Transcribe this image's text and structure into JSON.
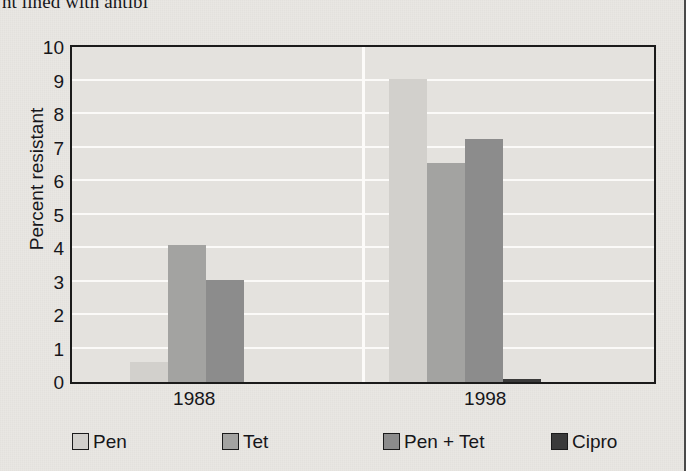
{
  "page": {
    "cutoff_text": "nt lined with antibi"
  },
  "chart_data": {
    "type": "bar",
    "title": "",
    "xlabel": "",
    "ylabel": "Percent resistant",
    "categories": [
      "1988",
      "1998"
    ],
    "ylim": [
      0,
      10
    ],
    "yticks": [
      0,
      1,
      2,
      3,
      4,
      5,
      6,
      7,
      8,
      9,
      10
    ],
    "ytick_labels": [
      "0",
      "1",
      "2",
      "3",
      "4",
      "5",
      "6",
      "7",
      "8",
      "9",
      "10"
    ],
    "grid": true,
    "legend_position": "bottom",
    "series": [
      {
        "name": "Pen",
        "color": "#d2d0cc",
        "values": [
          0.6,
          9.05
        ]
      },
      {
        "name": "Tet",
        "color": "#a3a3a1",
        "values": [
          4.1,
          6.55
        ]
      },
      {
        "name": "Pen + Tet",
        "color": "#8c8c8c",
        "values": [
          3.05,
          7.25
        ]
      },
      {
        "name": "Cipro",
        "color": "#3a3a3a",
        "values": [
          0,
          0.1
        ]
      }
    ]
  },
  "legend": {
    "items": [
      {
        "label": "Pen",
        "color": "#d2d0cc"
      },
      {
        "label": "Tet",
        "color": "#a3a3a1"
      },
      {
        "label": "Pen + Tet",
        "color": "#8c8c8c"
      },
      {
        "label": "Cipro",
        "color": "#3a3a3a"
      }
    ]
  },
  "colors": {
    "plot_background": "#e4e2de",
    "page_background": "#e9e7e3",
    "axis": "#1b1b1b",
    "gridline": "#fbfaf8",
    "text": "#16161a"
  }
}
